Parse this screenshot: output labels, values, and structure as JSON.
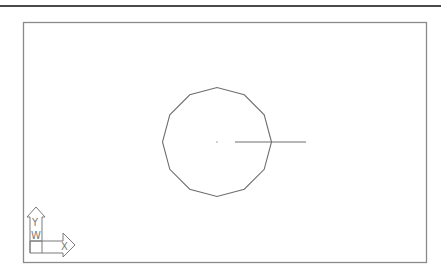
{
  "app": {
    "view": "Model space drawing viewport"
  },
  "drawing": {
    "entities": [
      {
        "type": "polygon",
        "sides": 12,
        "label": "12-sided polygon"
      },
      {
        "type": "line",
        "label": "horizontal line through polygon"
      },
      {
        "type": "point",
        "label": "center point"
      }
    ]
  },
  "ucs_icon": {
    "x_label": "X",
    "y_label": "Y",
    "w_label": "W"
  },
  "colors": {
    "background": "#ffffff",
    "geometry": "#6e6e6e",
    "frame": "#8a8a8a"
  }
}
